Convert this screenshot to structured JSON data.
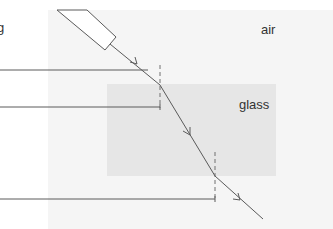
{
  "labels": {
    "air": "air",
    "glass": "glass",
    "cut_off_text": "g"
  },
  "colors": {
    "background": "#ffffff",
    "air_region": "#f5f5f5",
    "glass_region": "#e6e6e6",
    "line": "#5a5a5a",
    "normal": "#707070",
    "text": "#333333"
  },
  "geometry": {
    "air_region": {
      "x": 48,
      "y": 10,
      "w": 285,
      "h": 219
    },
    "glass_block": {
      "x": 107,
      "y": 84,
      "w": 169,
      "h": 92
    },
    "ray_box": {
      "points": "57,10 105,50 116,37 87,10"
    },
    "incident_ray": {
      "x1": 110,
      "y1": 44,
      "x2": 160,
      "y2": 85
    },
    "refracted_ray": {
      "x1": 160,
      "y1": 85,
      "x2": 215,
      "y2": 176
    },
    "emergent_ray": {
      "x1": 215,
      "y1": 176,
      "x2": 263,
      "y2": 219
    },
    "normal_entry": {
      "x": 160,
      "y1": 65,
      "y2": 108
    },
    "normal_exit": {
      "x": 215,
      "y1": 152,
      "y2": 200
    },
    "leader_lines": [
      {
        "y": 70,
        "x1": 0,
        "x2": 148
      },
      {
        "y": 107,
        "x1": 0,
        "x2": 160
      },
      {
        "y": 199,
        "x1": 0,
        "x2": 215
      }
    ]
  }
}
